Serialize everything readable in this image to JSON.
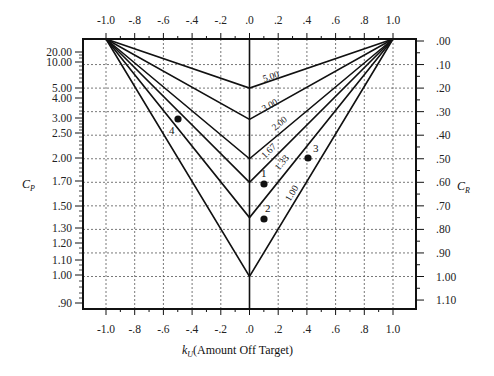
{
  "chart_data": {
    "type": "line",
    "title": "",
    "xlabel": "k_U (Amount Off Target)",
    "xlabel_main": "k",
    "xlabel_sub": "U",
    "xlabel_rest": "(Amount Off Target)",
    "ylabel_left": "C_P",
    "ylabel_left_main": "C",
    "ylabel_left_sub": "P",
    "ylabel_right": "C_R",
    "ylabel_right_main": "C",
    "ylabel_right_sub": "R",
    "xlim": [
      -1.0,
      1.0
    ],
    "x_ticks": [
      "-1.0",
      "-.8",
      "-.6",
      "-.4",
      "-.2",
      ".0",
      ".2",
      ".4",
      ".6",
      ".8",
      "1.0"
    ],
    "y_left_ticks": [
      "20.00",
      "10.00",
      "5.00",
      "4.00",
      "3.00",
      "2.50",
      "2.00",
      "1.70",
      "1.50",
      "1.30",
      "1.20",
      "1.10",
      "1.00",
      ".90"
    ],
    "y_right_ticks": [
      ".00",
      ".10",
      ".20",
      ".30",
      ".40",
      ".50",
      ".60",
      ".70",
      ".80",
      ".90",
      "1.00",
      "1.10"
    ],
    "ylim_right": [
      0.0,
      1.1
    ],
    "grid": true,
    "series": [
      {
        "name": "5.00",
        "label": "5.00",
        "vertex_cr": 0.2
      },
      {
        "name": "3.00",
        "label": "3.00",
        "vertex_cr": 0.333
      },
      {
        "name": "2.00",
        "label": "2.00",
        "vertex_cr": 0.5
      },
      {
        "name": "1.67",
        "label": "1.67",
        "vertex_cr": 0.6
      },
      {
        "name": "1.33",
        "label": "1.33",
        "vertex_cr": 0.75
      },
      {
        "name": "1.00",
        "label": "1.00",
        "vertex_cr": 1.0
      }
    ],
    "points": [
      {
        "label": "1",
        "x": 0.1,
        "cp": 1.65
      },
      {
        "label": "2",
        "x": 0.1,
        "cp": 1.32
      },
      {
        "label": "3",
        "x": 0.4,
        "cp": 2.0
      },
      {
        "label": "4",
        "x": -0.5,
        "cp": 3.0
      }
    ]
  }
}
